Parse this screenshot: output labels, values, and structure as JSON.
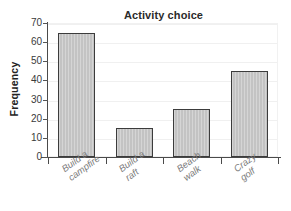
{
  "chart_data": {
    "type": "bar",
    "title": "Activity choice",
    "xlabel": "",
    "ylabel": "Frequency",
    "categories": [
      "Build a campfire",
      "Build a raft",
      "Beach walk",
      "Crazy golf"
    ],
    "category_lines": [
      [
        "Build a",
        "campfire"
      ],
      [
        "Build a",
        "raft"
      ],
      [
        "Beach",
        "walk"
      ],
      [
        "Crazy",
        "golf"
      ]
    ],
    "values": [
      65,
      15,
      25,
      45
    ],
    "ylim": [
      0,
      70
    ],
    "yticks": [
      0,
      10,
      20,
      30,
      40,
      50,
      60,
      70
    ],
    "ytick_labels": [
      "0",
      "10",
      "20",
      "30",
      "40",
      "50",
      "60",
      "70"
    ],
    "grid": true,
    "legend": null,
    "bar_fill_color": "#c3c3c3",
    "bar_edge_color": "#3c3c3c",
    "axis_color": "#4a4a4a",
    "gridline_color": "#f0f0f0",
    "title_color": "#2b2b2b",
    "tick_label_color": "#3a3a3a",
    "category_label_color": "#7b7b7b",
    "background_color": "#ffffff"
  }
}
